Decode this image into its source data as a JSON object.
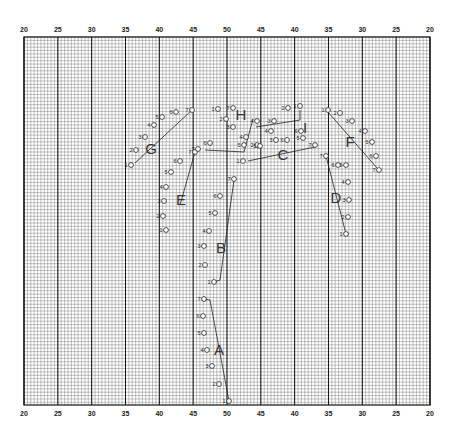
{
  "grid": {
    "left": 24,
    "right": 430,
    "top": 37,
    "bottom": 405,
    "major_step": 33.83,
    "minor_divisions": 10,
    "line_color": "#111111",
    "minor_color": "#555555"
  },
  "axis_labels": {
    "top": [
      "20",
      "25",
      "30",
      "35",
      "40",
      "45",
      "50",
      "45",
      "40",
      "35",
      "30",
      "25",
      "20"
    ],
    "bottom": [
      "20",
      "25",
      "30",
      "35",
      "40",
      "45",
      "50",
      "45",
      "40",
      "35",
      "30",
      "25",
      "20"
    ]
  },
  "groups": [
    {
      "name": "A",
      "label_pos": [
        219,
        350
      ],
      "points": [
        [
          229,
          401,
          "1"
        ],
        [
          219,
          384,
          "2"
        ],
        [
          212,
          366,
          "3"
        ],
        [
          207,
          350,
          "4"
        ],
        [
          204,
          333,
          "5"
        ],
        [
          203,
          316,
          "6"
        ],
        [
          204,
          299,
          "7"
        ]
      ],
      "line": [
        [
          204,
          299
        ],
        [
          210,
          300
        ],
        [
          229,
          401
        ]
      ]
    },
    {
      "name": "B",
      "label_pos": [
        221,
        248
      ],
      "points": [
        [
          214,
          282,
          "1"
        ],
        [
          205,
          265,
          "2"
        ],
        [
          204,
          246,
          "3"
        ],
        [
          209,
          231,
          "4"
        ],
        [
          215,
          213,
          "5"
        ],
        [
          220,
          196,
          "6"
        ],
        [
          234,
          179,
          "7"
        ]
      ],
      "line": [
        [
          214,
          282
        ],
        [
          220,
          280
        ],
        [
          234,
          180
        ]
      ]
    },
    {
      "name": "C",
      "label_pos": [
        283,
        155
      ],
      "points": [
        [
          243,
          161,
          "1"
        ],
        [
          257,
          145,
          "2"
        ],
        [
          276,
          140,
          "3"
        ],
        [
          271,
          131,
          "4"
        ],
        [
          303,
          138,
          "5"
        ],
        [
          301,
          131,
          "6"
        ],
        [
          315,
          145,
          "7"
        ]
      ],
      "line": [
        [
          248,
          161
        ],
        [
          315,
          147
        ]
      ]
    },
    {
      "name": "D",
      "label_pos": [
        336,
        198
      ],
      "points": [
        [
          346,
          234,
          "1"
        ],
        [
          348,
          217,
          "2"
        ],
        [
          349,
          200,
          "3"
        ],
        [
          348,
          182,
          "4"
        ],
        [
          346,
          165,
          "5"
        ],
        [
          338,
          165,
          "6"
        ],
        [
          326,
          156,
          "7"
        ]
      ],
      "line": [
        [
          326,
          156
        ],
        [
          346,
          234
        ]
      ]
    },
    {
      "name": "E",
      "label_pos": [
        181,
        200
      ],
      "points": [
        [
          166,
          230,
          "1"
        ],
        [
          163,
          216,
          "2"
        ],
        [
          164,
          201,
          "3"
        ],
        [
          166,
          187,
          "4"
        ],
        [
          171,
          172,
          "5"
        ],
        [
          180,
          161,
          "6"
        ],
        [
          195,
          152,
          "7"
        ]
      ],
      "line": [
        [
          195,
          152
        ],
        [
          180,
          205
        ]
      ]
    },
    {
      "name": "F",
      "label_pos": [
        350,
        142
      ],
      "points": [
        [
          328,
          110,
          "1"
        ],
        [
          340,
          113,
          "2"
        ],
        [
          352,
          121,
          "3"
        ],
        [
          365,
          131,
          "4"
        ],
        [
          372,
          142,
          "5"
        ],
        [
          376,
          156,
          "6"
        ],
        [
          379,
          170,
          "7"
        ]
      ],
      "line": [
        [
          328,
          112
        ],
        [
          377,
          168
        ]
      ]
    },
    {
      "name": "G",
      "label_pos": [
        151,
        149
      ],
      "points": [
        [
          131,
          165,
          "1"
        ],
        [
          136,
          150,
          "2"
        ],
        [
          145,
          137,
          "3"
        ],
        [
          154,
          125,
          "4"
        ],
        [
          162,
          117,
          "5"
        ],
        [
          176,
          112,
          "6"
        ],
        [
          192,
          110,
          "7"
        ]
      ],
      "line": [
        [
          135,
          163
        ],
        [
          192,
          110
        ]
      ]
    },
    {
      "name": "H",
      "label_pos": [
        241,
        115
      ],
      "points": [
        [
          218,
          109,
          "1"
        ],
        [
          226,
          119,
          "2"
        ],
        [
          233,
          127,
          "3"
        ],
        [
          246,
          137,
          "4"
        ],
        [
          244,
          145,
          "5"
        ],
        [
          210,
          143,
          "6"
        ],
        [
          198,
          149,
          "7"
        ]
      ],
      "line": [
        [
          205,
          150
        ],
        [
          244,
          152
        ],
        [
          253,
          119
        ]
      ]
    },
    {
      "name": "I",
      "label_pos": [
        305,
        128
      ],
      "points": [
        [
          300,
          106,
          "1"
        ],
        [
          288,
          108,
          "2"
        ],
        [
          274,
          121,
          "3"
        ],
        [
          257,
          121,
          "4"
        ],
        [
          260,
          146,
          "5"
        ],
        [
          287,
          140,
          "6"
        ],
        [
          233,
          108,
          "7"
        ]
      ],
      "line": [
        [
          256,
          127
        ],
        [
          300,
          120
        ],
        [
          300,
          110
        ]
      ]
    }
  ],
  "colors": {
    "ink": "#222222",
    "paper": "#ffffff"
  }
}
